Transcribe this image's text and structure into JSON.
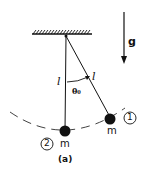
{
  "figure": {
    "caption": "(a)",
    "gravity_label": "g",
    "length_label_left": "l",
    "length_label_right": "l",
    "angle_label": "θ₀",
    "bob_left": {
      "mass_label": "m",
      "number": "2"
    },
    "bob_right": {
      "mass_label": "m",
      "number": "1"
    }
  }
}
